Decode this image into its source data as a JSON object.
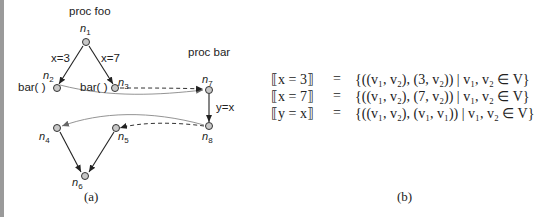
{
  "figure_a": {
    "proc_foo": "proc foo",
    "proc_bar": "proc bar",
    "nodes": {
      "n1": {
        "name": "n",
        "sub": "1"
      },
      "n2": {
        "name": "n",
        "sub": "2"
      },
      "n3": {
        "name": "n",
        "sub": "3"
      },
      "n4": {
        "name": "n",
        "sub": "4"
      },
      "n5": {
        "name": "n",
        "sub": "5"
      },
      "n6": {
        "name": "n",
        "sub": "6"
      },
      "n7": {
        "name": "n",
        "sub": "7"
      },
      "n8": {
        "name": "n",
        "sub": "8"
      }
    },
    "edge_labels": {
      "e12": "x=3",
      "e13": "x=7",
      "e78": "y=x"
    },
    "call_labels": {
      "n2": "bar( )",
      "n3": "bar( )"
    },
    "caption": "(a)"
  },
  "figure_b": {
    "rows": [
      {
        "lhs": "⟦x = 3⟧",
        "eq": "=",
        "rhs": "{((v₁, v₂), (3, v₂)) | v₁, v₂ ∈ V}"
      },
      {
        "lhs": "⟦x = 7⟧",
        "eq": "=",
        "rhs": "{((v₁, v₂), (7, v₂)) | v₁, v₂ ∈ V}"
      },
      {
        "lhs": "⟦y = x⟧",
        "eq": "=",
        "rhs": "{((v₁, v₂), (v₁, v₁)) | v₁, v₂ ∈ V}"
      }
    ],
    "caption": "(b)"
  }
}
